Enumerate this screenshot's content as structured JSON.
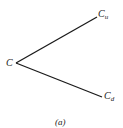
{
  "diagram": {
    "type": "binomial-tree-one-step",
    "nodes": {
      "root": {
        "label": "C"
      },
      "up": {
        "label": "C",
        "subscript": "u"
      },
      "down": {
        "label": "C",
        "subscript": "d"
      }
    },
    "edges": [
      {
        "from": "root",
        "to": "up"
      },
      {
        "from": "root",
        "to": "down"
      }
    ],
    "caption": "(a)",
    "line_color": "#1a1a1a"
  }
}
